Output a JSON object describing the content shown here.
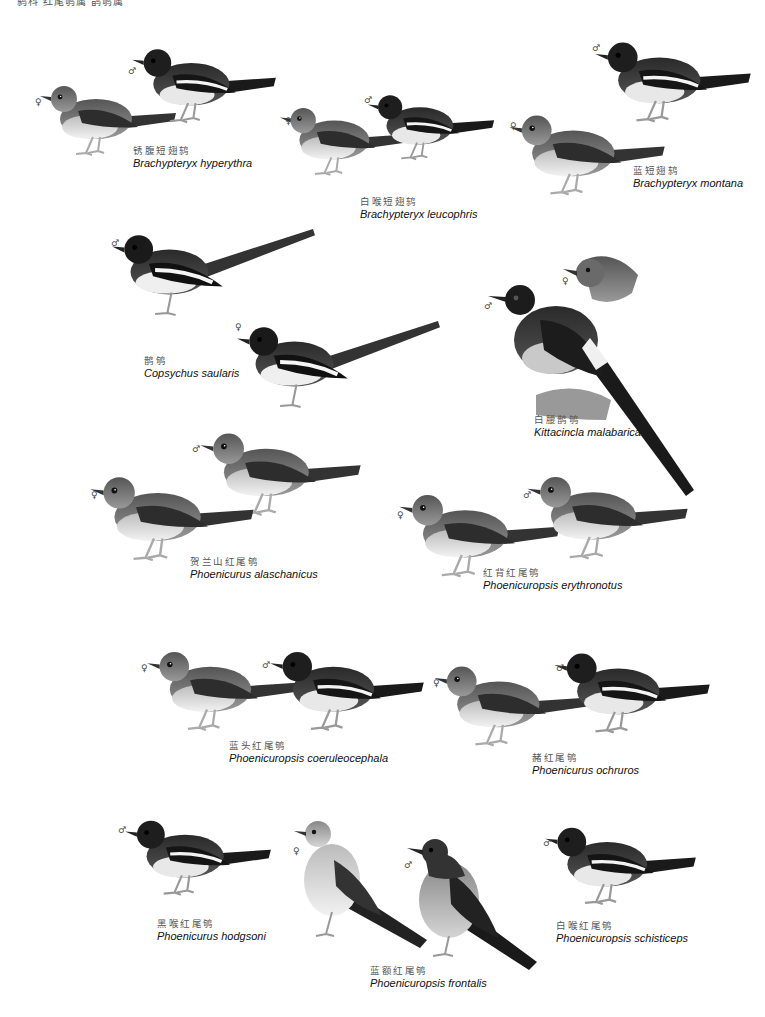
{
  "page": {
    "header_text": "鸫科 红尾鸲属 鹊鸲属"
  },
  "symbols": {
    "male": "♂",
    "female": "♀"
  },
  "colors": {
    "background": "#ffffff",
    "dark": "#1a1a1a",
    "mid": "#666666",
    "light": "#bdbdbd",
    "pale": "#e6e6e6"
  },
  "species": [
    {
      "id": "brachypteryx-hyperythra",
      "chinese": "锈腹短翅鸫",
      "latin": "Brachypteryx hyperythra"
    },
    {
      "id": "brachypteryx-leucophris",
      "chinese": "白喉短翅鸫",
      "latin": "Brachypteryx leucophris"
    },
    {
      "id": "brachypteryx-montana",
      "chinese": "蓝短翅鸫",
      "latin": "Brachypteryx montana"
    },
    {
      "id": "copsychus-saularis",
      "chinese": "鹊鸲",
      "latin": "Copsychus saularis"
    },
    {
      "id": "kittacincla-malabarica",
      "chinese": "白腰鹊鸲",
      "latin": "Kittacincla malabarica"
    },
    {
      "id": "phoenicurus-alaschanicus",
      "chinese": "贺兰山红尾鸲",
      "latin": "Phoenicurus alaschanicus"
    },
    {
      "id": "phoenicuropsis-erythronotus",
      "chinese": "红背红尾鸲",
      "latin": "Phoenicuropsis erythronotus"
    },
    {
      "id": "phoenicuropsis-coeruleocephala",
      "chinese": "蓝头红尾鸲",
      "latin": "Phoenicuropsis  coeruleocephala"
    },
    {
      "id": "phoenicurus-ochruros",
      "chinese": "赭红尾鸲",
      "latin": "Phoenicurus ochruros"
    },
    {
      "id": "phoenicurus-hodgsoni",
      "chinese": "黑喉红尾鸲",
      "latin": "Phoenicurus hodgsoni"
    },
    {
      "id": "phoenicuropsis-frontalis",
      "chinese": "蓝额红尾鸲",
      "latin": "Phoenicuropsis frontalis"
    },
    {
      "id": "phoenicuropsis-schisticeps",
      "chinese": "白喉红尾鸲",
      "latin": "Phoenicuropsis schisticeps"
    }
  ]
}
